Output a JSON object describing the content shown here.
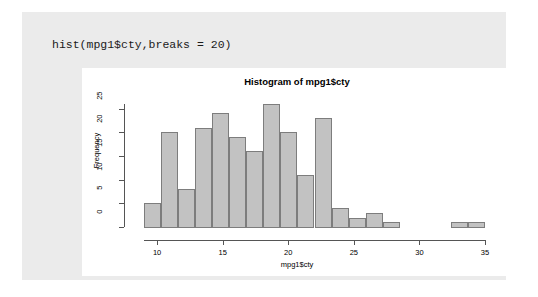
{
  "console": {
    "command": "hist(mpg1$cty,breaks = 20)"
  },
  "colors": {
    "panel_background": "#ebebeb",
    "plot_background": "#ffffff",
    "bar_fill": "#c2c2c2",
    "bar_border": "#7d7d7d",
    "axis": "#555555",
    "text": "#000000"
  },
  "chart_data": {
    "type": "bar",
    "title": "Histogram of mpg1$cty",
    "xlabel": "mpg1$cty",
    "ylabel": "Frequency",
    "xlim": [
      9,
      35
    ],
    "ylim": [
      0,
      26
    ],
    "xticks": [
      10,
      15,
      20,
      25,
      30,
      35
    ],
    "yticks": [
      0,
      5,
      10,
      15,
      20,
      25
    ],
    "grid": false,
    "legend": null,
    "bin_width": 1.3,
    "bins": [
      {
        "start": 9.0,
        "end": 10.3,
        "value": 5
      },
      {
        "start": 10.3,
        "end": 11.6,
        "value": 20
      },
      {
        "start": 11.6,
        "end": 12.9,
        "value": 8
      },
      {
        "start": 12.9,
        "end": 14.2,
        "value": 21
      },
      {
        "start": 14.2,
        "end": 15.5,
        "value": 24
      },
      {
        "start": 15.5,
        "end": 16.8,
        "value": 19
      },
      {
        "start": 16.8,
        "end": 18.1,
        "value": 16
      },
      {
        "start": 18.1,
        "end": 19.4,
        "value": 26
      },
      {
        "start": 19.4,
        "end": 20.7,
        "value": 20
      },
      {
        "start": 20.7,
        "end": 22.0,
        "value": 11
      },
      {
        "start": 22.0,
        "end": 23.3,
        "value": 23
      },
      {
        "start": 23.3,
        "end": 24.6,
        "value": 4
      },
      {
        "start": 24.6,
        "end": 25.9,
        "value": 2
      },
      {
        "start": 25.9,
        "end": 27.2,
        "value": 3
      },
      {
        "start": 27.2,
        "end": 28.5,
        "value": 1
      },
      {
        "start": 28.5,
        "end": 29.8,
        "value": 0
      },
      {
        "start": 29.8,
        "end": 31.1,
        "value": 0
      },
      {
        "start": 31.1,
        "end": 32.4,
        "value": 0
      },
      {
        "start": 32.4,
        "end": 33.7,
        "value": 1
      },
      {
        "start": 33.7,
        "end": 35.0,
        "value": 1
      }
    ]
  }
}
